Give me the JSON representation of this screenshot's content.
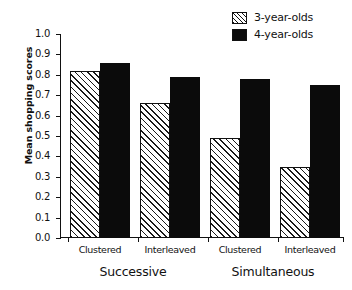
{
  "chart_data": {
    "type": "bar",
    "title": "",
    "subtitle": "",
    "xlabel": "",
    "ylabel": "Mean shopping scores",
    "ylim": [
      0.0,
      1.0
    ],
    "ytick_labels": [
      "0.0",
      "0.1",
      "0.2",
      "0.3",
      "0.4",
      "0.5",
      "0.6",
      "0.7",
      "0.8",
      "0.9",
      "1.0"
    ],
    "ytick_values": [
      0.0,
      0.1,
      0.2,
      0.3,
      0.4,
      0.5,
      0.6,
      0.7,
      0.8,
      0.9,
      1.0
    ],
    "grid": false,
    "legend_position": "top-right",
    "categories": [
      "Clustered",
      "Interleaved",
      "Clustered",
      "Interleaved"
    ],
    "groups": [
      {
        "label": "Successive",
        "categories": [
          "Clustered",
          "Interleaved"
        ]
      },
      {
        "label": "Simultaneous",
        "categories": [
          "Clustered",
          "Interleaved"
        ]
      }
    ],
    "series": [
      {
        "name": "3-year-olds",
        "fill": "hatched-diagonal",
        "color": "#ffffff",
        "values": [
          0.82,
          0.66,
          0.49,
          0.35
        ]
      },
      {
        "name": "4-year-olds",
        "fill": "solid",
        "color": "#0b0b0b",
        "values": [
          0.86,
          0.79,
          0.78,
          0.75
        ]
      }
    ]
  },
  "legend": {
    "items": [
      {
        "label": "3-year-olds",
        "swatch": "hatched-diagonal"
      },
      {
        "label": "4-year-olds",
        "swatch": "solid-black"
      }
    ]
  },
  "axes": {
    "y_title": "Mean shopping scores",
    "y_ticks": [
      "1.0",
      "0.9",
      "0.8",
      "0.7",
      "0.6",
      "0.5",
      "0.4",
      "0.3",
      "0.2",
      "0.1",
      "0.0"
    ],
    "x_category_labels": [
      "Clustered",
      "Interleaved",
      "Clustered",
      "Interleaved"
    ],
    "x_group_labels": [
      "Successive",
      "Simultaneous"
    ]
  },
  "colors": {
    "axis": "#111111",
    "bar_solid": "#0b0b0b",
    "bar_hatch_line": "#1a1a1a",
    "background": "#ffffff"
  }
}
